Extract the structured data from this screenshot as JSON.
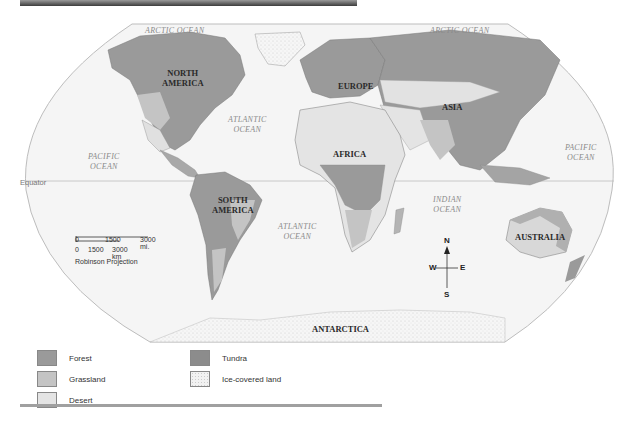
{
  "map": {
    "title": "World Biomes Map",
    "projection": "Robinson Projection",
    "equator_label": "Equator",
    "oceans": [
      {
        "id": "arctic-left",
        "label": "ARCTIC OCEAN"
      },
      {
        "id": "arctic-right",
        "label": "ARCTIC OCEAN"
      },
      {
        "id": "pacific-left",
        "label": "PACIFIC\nOCEAN"
      },
      {
        "id": "pacific-right",
        "label": "PACIFIC\nOCEAN"
      },
      {
        "id": "atlantic-north",
        "label": "ATLANTIC\nOCEAN"
      },
      {
        "id": "atlantic-south",
        "label": "ATLANTIC\nOCEAN"
      },
      {
        "id": "indian",
        "label": "INDIAN\nOCEAN"
      }
    ],
    "continents": [
      {
        "id": "north-america",
        "label": "NORTH\nAMERICA"
      },
      {
        "id": "south-america",
        "label": "SOUTH\nAMERICA"
      },
      {
        "id": "europe",
        "label": "EUROPE"
      },
      {
        "id": "africa",
        "label": "AFRICA"
      },
      {
        "id": "asia",
        "label": "ASIA"
      },
      {
        "id": "australia",
        "label": "AUSTRALIA"
      },
      {
        "id": "antarctica",
        "label": "ANTARCTICA"
      }
    ],
    "scale": {
      "miles": [
        "0",
        "1500",
        "3000 mi."
      ],
      "km": [
        "0",
        "1500",
        "3000 km"
      ]
    },
    "compass": {
      "n": "N",
      "s": "S",
      "e": "E",
      "w": "W"
    }
  },
  "legend": {
    "items": [
      {
        "label": "Forest",
        "color": "#9a9a9a"
      },
      {
        "label": "Grassland",
        "color": "#c4c4c4"
      },
      {
        "label": "Desert",
        "color": "#e4e4e4"
      },
      {
        "label": "Tundra",
        "color": "#8c8c8c"
      },
      {
        "label": "Ice-covered land",
        "color": "#f2f2f2"
      }
    ]
  },
  "colors": {
    "ocean": "#f4f4f4",
    "border": "#bdbdbd",
    "forest": "#9a9a9a",
    "grassland": "#c4c4c4",
    "desert": "#e4e4e4",
    "tundra": "#8c8c8c",
    "ice": "#f2f2f2"
  }
}
